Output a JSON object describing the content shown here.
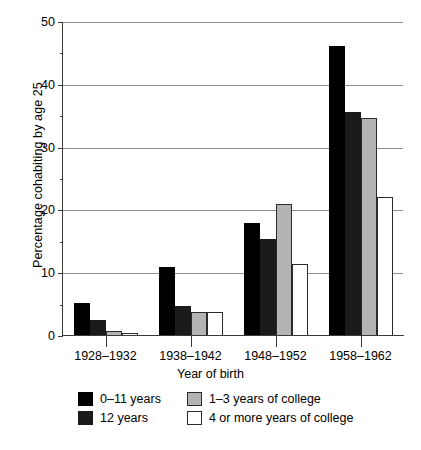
{
  "chart_data": {
    "type": "bar",
    "title": "",
    "xlabel": "Year of birth",
    "ylabel": "Percentage cohabiting by age 25",
    "categories": [
      "1928–1932",
      "1938–1942",
      "1948–1952",
      "1958–1962"
    ],
    "series": [
      {
        "name": "0–11 years",
        "values": [
          5.2,
          11.0,
          18.0,
          46.2
        ]
      },
      {
        "name": "12 years",
        "values": [
          2.5,
          4.8,
          15.5,
          35.7
        ]
      },
      {
        "name": "1–3 years of college",
        "values": [
          0.8,
          3.9,
          21.0,
          34.7
        ]
      },
      {
        "name": "4 or more years of college",
        "values": [
          0.5,
          3.8,
          11.5,
          22.2
        ]
      }
    ],
    "ylim": [
      0,
      50
    ],
    "yticks": [
      0,
      10,
      20,
      30,
      40,
      50
    ],
    "yticks_minor": [
      5,
      15,
      25,
      35,
      45
    ],
    "ytick_labels": [
      "0",
      "10",
      "20",
      "30",
      "40",
      "50"
    ],
    "grid": "horizontal",
    "legend_position": "below-axis",
    "series_colors": [
      "#000000",
      "#1b1b1b",
      "#b4b4b4",
      "#ffffff"
    ]
  },
  "caption": {
    "sliver_text": ""
  }
}
